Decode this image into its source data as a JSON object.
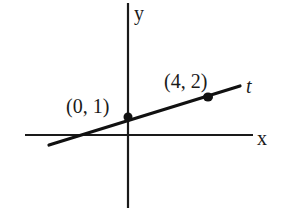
{
  "diagram": {
    "type": "coordinate-plane-line",
    "axes": {
      "x_label": "x",
      "y_label": "y"
    },
    "line": {
      "label": "t",
      "points": [
        {
          "label": "(0, 1)",
          "x": 0,
          "y": 1
        },
        {
          "label": "(4, 2)",
          "x": 4,
          "y": 2
        }
      ]
    },
    "colors": {
      "ink": "#111111",
      "background": "#ffffff"
    }
  }
}
